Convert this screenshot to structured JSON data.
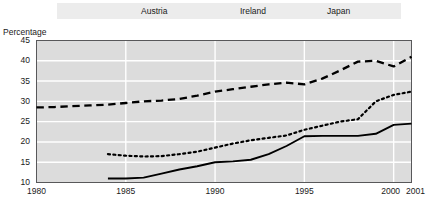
{
  "chart_data": {
    "type": "line",
    "title": "",
    "subtitle": "",
    "xlabel": "",
    "ylabel": "Percentage",
    "ylim": [
      10,
      45
    ],
    "ytick_values": [
      10,
      15,
      20,
      25,
      30,
      35,
      40,
      45
    ],
    "ytick_labels": [
      "10",
      "15",
      "20",
      "25",
      "30",
      "35",
      "40",
      "45"
    ],
    "xlim": [
      1980,
      2001
    ],
    "xtick_values": [
      1980,
      1985,
      1990,
      1995,
      2000,
      2001
    ],
    "xtick_labels": [
      "1980",
      "1985",
      "1990",
      "1995",
      "2000",
      "2001"
    ],
    "grid": true,
    "grid_color": "#ffffff",
    "plot_background": "#dcdcdc",
    "legend_position": "top",
    "legend_background": "#ececec",
    "series": [
      {
        "name": "Austria",
        "style": "solid",
        "color": "#000000",
        "x": [
          1984,
          1985,
          1986,
          1987,
          1988,
          1989,
          1990,
          1991,
          1992,
          1993,
          1994,
          1995,
          1996,
          1997,
          1998,
          1999,
          2000,
          2001
        ],
        "values": [
          11.0,
          11.0,
          11.2,
          12.2,
          13.2,
          14.0,
          15.0,
          15.2,
          15.6,
          17.0,
          19.0,
          21.4,
          21.5,
          21.5,
          21.5,
          22.0,
          24.2,
          24.5
        ]
      },
      {
        "name": "Ireland",
        "style": "dotted",
        "color": "#000000",
        "x": [
          1984,
          1985,
          1986,
          1987,
          1988,
          1989,
          1990,
          1991,
          1992,
          1993,
          1994,
          1995,
          1996,
          1997,
          1998,
          1999,
          2000,
          2001
        ],
        "values": [
          17.0,
          16.6,
          16.4,
          16.5,
          17.0,
          17.6,
          18.6,
          19.6,
          20.4,
          21.0,
          21.6,
          23.0,
          24.0,
          25.0,
          25.6,
          30.0,
          31.6,
          32.4
        ]
      },
      {
        "name": "Japan",
        "style": "dashed",
        "color": "#000000",
        "x": [
          1980,
          1981,
          1982,
          1983,
          1984,
          1985,
          1986,
          1987,
          1988,
          1989,
          1990,
          1991,
          1992,
          1993,
          1994,
          1995,
          1996,
          1997,
          1998,
          1999,
          2000,
          2001
        ],
        "values": [
          28.5,
          28.6,
          28.8,
          29.0,
          29.2,
          29.6,
          30.0,
          30.2,
          30.6,
          31.4,
          32.4,
          33.0,
          33.6,
          34.2,
          34.6,
          34.2,
          35.6,
          37.6,
          39.8,
          40.0,
          38.6,
          41.0
        ]
      }
    ]
  },
  "legend": {
    "items": [
      {
        "label": "Austria",
        "style": "solid"
      },
      {
        "label": "Ireland",
        "style": "dotted"
      },
      {
        "label": "Japan",
        "style": "dashed"
      }
    ]
  }
}
